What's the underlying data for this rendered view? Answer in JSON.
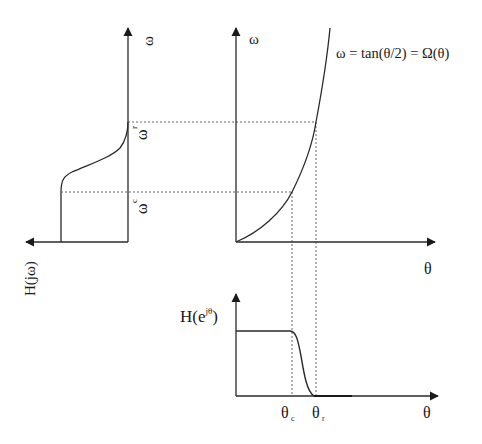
{
  "diagram": {
    "left_plot": {
      "v_axis_label": "ω",
      "h_axis_label": "H(jω)",
      "omega_r_label": "ω",
      "omega_r_sub": "r",
      "omega_c_label": "ω",
      "omega_c_sub": "c"
    },
    "middle_plot": {
      "v_axis_label": "ω",
      "h_axis_label": "θ",
      "curve_equation": "ω = tan(θ/2) = Ω(θ)"
    },
    "bottom_plot": {
      "v_axis_label_base": "H(e",
      "v_axis_label_sup": "jθ",
      "v_axis_label_close": ")",
      "h_axis_label": "θ",
      "theta_c_label": "θ",
      "theta_c_sub": "c",
      "theta_r_label": "θ",
      "theta_r_sub": "r"
    },
    "colors": {
      "line": "#2a2a2a",
      "dotted": "#555555"
    }
  }
}
